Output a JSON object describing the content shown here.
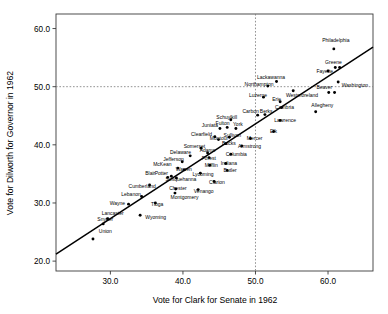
{
  "chart_data": {
    "type": "scatter",
    "title": "",
    "xlabel": "Vote for Clark for Senate in 1962",
    "ylabel": "Vote for Dilworth for Governor in 1962",
    "xlim": [
      22.5,
      66.2
    ],
    "ylim": [
      18.3,
      62.5
    ],
    "xticks": [
      "30.0",
      "40.0",
      "50.0",
      "60.0"
    ],
    "xtick_values": [
      30.0,
      40.0,
      50.0,
      60.0
    ],
    "yticks": [
      "20.0",
      "30.0",
      "40.0",
      "50.0",
      "60.0"
    ],
    "ytick_values": [
      20.0,
      30.0,
      40.0,
      50.0,
      60.0
    ],
    "grid": false,
    "legend": "none",
    "reference_lines": [
      {
        "name": "vertical-50-percent-line",
        "orientation": "vertical",
        "value": 50.0,
        "style": "dotted"
      },
      {
        "name": "horizontal-50-percent-line",
        "orientation": "horizontal",
        "value": 50.0,
        "style": "dotted"
      }
    ],
    "fit_line": {
      "name": "regression-line",
      "x0": 22.5,
      "y0": 21.2,
      "x1": 66.2,
      "y1": 56.8
    },
    "points": [
      {
        "label": "Union",
        "x": 27.6,
        "y": 23.8,
        "lx": 28.4,
        "ly": 24.9,
        "anchor": "start"
      },
      {
        "label": "Snyder",
        "x": 29.0,
        "y": 26.4,
        "lx": 28.2,
        "ly": 26.9,
        "anchor": "start"
      },
      {
        "label": "Lancaster",
        "x": 29.6,
        "y": 27.3,
        "lx": 28.8,
        "ly": 27.9,
        "anchor": "start"
      },
      {
        "label": "Wayne",
        "x": 32.5,
        "y": 29.8,
        "lx": 29.9,
        "ly": 29.7,
        "anchor": "start"
      },
      {
        "label": "Lebanon",
        "x": 34.3,
        "y": 31.1,
        "lx": 31.5,
        "ly": 31.2,
        "anchor": "start"
      },
      {
        "label": "Wyoming",
        "x": 34.1,
        "y": 27.9,
        "lx": 34.8,
        "ly": 27.2,
        "anchor": "start"
      },
      {
        "label": "Tioga",
        "x": 36.2,
        "y": 30.0,
        "lx": 35.6,
        "ly": 29.4,
        "anchor": "start"
      },
      {
        "label": "Cumberland",
        "x": 35.4,
        "y": 33.1,
        "lx": 32.5,
        "ly": 32.6,
        "anchor": "start"
      },
      {
        "label": "Blair",
        "x": 37.9,
        "y": 34.4,
        "lx": 34.8,
        "ly": 34.8,
        "anchor": "start"
      },
      {
        "label": "Potter",
        "x": 38.4,
        "y": 34.6,
        "lx": 36.1,
        "ly": 34.8,
        "anchor": "start"
      },
      {
        "label": "Montgomery",
        "x": 38.9,
        "y": 31.7,
        "lx": 38.3,
        "ly": 30.7,
        "anchor": "start"
      },
      {
        "label": "Chester",
        "x": 39.0,
        "y": 32.4,
        "lx": 38.1,
        "ly": 32.2,
        "anchor": "start"
      },
      {
        "label": "Susquehanna",
        "x": 39.1,
        "y": 34.3,
        "lx": 37.6,
        "ly": 33.8,
        "anchor": "start"
      },
      {
        "label": "McKean",
        "x": 39.3,
        "y": 36.0,
        "lx": 35.9,
        "ly": 36.4,
        "anchor": "start"
      },
      {
        "label": "Jefferson",
        "x": 39.9,
        "y": 37.1,
        "lx": 37.3,
        "ly": 37.3,
        "anchor": "start"
      },
      {
        "label": "Warren",
        "x": 40.2,
        "y": 35.7,
        "lx": 39.0,
        "ly": 35.5,
        "anchor": "start"
      },
      {
        "label": "Delaware",
        "x": 41.0,
        "y": 38.1,
        "lx": 38.2,
        "ly": 38.4,
        "anchor": "start"
      },
      {
        "label": "Venango",
        "x": 42.1,
        "y": 32.3,
        "lx": 41.5,
        "ly": 31.8,
        "anchor": "start"
      },
      {
        "label": "Lycoming",
        "x": 42.4,
        "y": 35.1,
        "lx": 41.3,
        "ly": 34.7,
        "anchor": "start"
      },
      {
        "label": "Somerset",
        "x": 42.5,
        "y": 39.4,
        "lx": 40.1,
        "ly": 39.5,
        "anchor": "start"
      },
      {
        "label": "Clarion",
        "x": 44.3,
        "y": 33.7,
        "lx": 43.6,
        "ly": 33.3,
        "anchor": "start"
      },
      {
        "label": "Mifflin",
        "x": 43.7,
        "y": 36.5,
        "lx": 43.0,
        "ly": 36.2,
        "anchor": "start"
      },
      {
        "label": "Forest",
        "x": 43.6,
        "y": 37.8,
        "lx": 42.6,
        "ly": 37.4,
        "anchor": "start"
      },
      {
        "label": "Adams",
        "x": 43.4,
        "y": 38.6,
        "lx": 42.3,
        "ly": 38.8,
        "anchor": "start"
      },
      {
        "label": "Clearfield",
        "x": 44.4,
        "y": 41.4,
        "lx": 41.1,
        "ly": 41.6,
        "anchor": "start"
      },
      {
        "label": "Montour",
        "x": 44.9,
        "y": 40.9,
        "lx": 43.7,
        "ly": 40.8,
        "anchor": "start"
      },
      {
        "label": "Butler",
        "x": 46.1,
        "y": 35.6,
        "lx": 45.6,
        "ly": 35.3,
        "anchor": "start"
      },
      {
        "label": "Indiana",
        "x": 45.9,
        "y": 36.8,
        "lx": 45.2,
        "ly": 36.6,
        "anchor": "start"
      },
      {
        "label": "Columbia",
        "x": 46.6,
        "y": 38.4,
        "lx": 45.9,
        "ly": 38.1,
        "anchor": "start"
      },
      {
        "label": "Bucks",
        "x": 45.9,
        "y": 40.2,
        "lx": 45.4,
        "ly": 40.0,
        "anchor": "start"
      },
      {
        "label": "Sullivan",
        "x": 46.4,
        "y": 41.3,
        "lx": 45.6,
        "ly": 41.4,
        "anchor": "start"
      },
      {
        "label": "Juniata",
        "x": 45.1,
        "y": 42.8,
        "lx": 42.6,
        "ly": 43.0,
        "anchor": "start"
      },
      {
        "label": "Fulton",
        "x": 46.1,
        "y": 43.0,
        "lx": 44.5,
        "ly": 43.4,
        "anchor": "start"
      },
      {
        "label": "Schuylkill",
        "x": 46.6,
        "y": 44.3,
        "lx": 44.6,
        "ly": 44.5,
        "anchor": "start"
      },
      {
        "label": "York",
        "x": 47.3,
        "y": 42.8,
        "lx": 46.9,
        "ly": 43.3,
        "anchor": "start"
      },
      {
        "label": "Armstrong",
        "x": 48.1,
        "y": 39.8,
        "lx": 47.6,
        "ly": 39.5,
        "anchor": "start"
      },
      {
        "label": "Mercer",
        "x": 49.3,
        "y": 41.1,
        "lx": 48.8,
        "ly": 40.8,
        "anchor": "start"
      },
      {
        "label": "Carbon",
        "x": 50.3,
        "y": 45.1,
        "lx": 48.2,
        "ly": 45.4,
        "anchor": "start"
      },
      {
        "label": "Berks",
        "x": 51.3,
        "y": 45.2,
        "lx": 50.6,
        "ly": 45.5,
        "anchor": "start"
      },
      {
        "label": "Luzerne",
        "x": 51.1,
        "y": 48.2,
        "lx": 49.1,
        "ly": 48.3,
        "anchor": "start"
      },
      {
        "label": "Northampton",
        "x": 51.7,
        "y": 50.1,
        "lx": 48.5,
        "ly": 50.1,
        "anchor": "start"
      },
      {
        "label": "Lackawanna",
        "x": 52.9,
        "y": 50.9,
        "lx": 50.2,
        "ly": 51.4,
        "anchor": "start"
      },
      {
        "label": "Elk",
        "x": 52.5,
        "y": 42.3,
        "lx": 52.0,
        "ly": 42.0,
        "anchor": "start"
      },
      {
        "label": "Lawrence",
        "x": 53.4,
        "y": 44.2,
        "lx": 52.6,
        "ly": 44.0,
        "anchor": "start"
      },
      {
        "label": "Cambria",
        "x": 53.6,
        "y": 46.4,
        "lx": 52.7,
        "ly": 46.2,
        "anchor": "start"
      },
      {
        "label": "Erie",
        "x": 53.4,
        "y": 47.4,
        "lx": 52.3,
        "ly": 47.6,
        "anchor": "start"
      },
      {
        "label": "Westmoreland",
        "x": 55.2,
        "y": 49.3,
        "lx": 54.2,
        "ly": 48.2,
        "anchor": "start"
      },
      {
        "label": "Allegheny",
        "x": 58.3,
        "y": 45.7,
        "lx": 57.7,
        "ly": 46.5,
        "anchor": "start"
      },
      {
        "label": "Beaver",
        "x": 60.1,
        "y": 49.0,
        "lx": 58.4,
        "ly": 49.6,
        "anchor": "start"
      },
      {
        "label": "Washington",
        "x": 61.4,
        "y": 50.8,
        "lx": 61.9,
        "ly": 50.0,
        "anchor": "start"
      },
      {
        "label": "Fayette",
        "x": 60.0,
        "y": 52.7,
        "lx": 58.4,
        "ly": 52.4,
        "anchor": "start"
      },
      {
        "label": "Greene",
        "x": 61.0,
        "y": 53.3,
        "lx": 59.6,
        "ly": 53.9,
        "anchor": "start"
      },
      {
        "label": "Philadelphia",
        "x": 60.8,
        "y": 56.5,
        "lx": 59.2,
        "ly": 57.6,
        "anchor": "start"
      },
      {
        "label": "Unnamed1",
        "x": 60.9,
        "y": 49.0,
        "lx": 0,
        "ly": 0,
        "anchor": "none"
      },
      {
        "label": "Unnamed2",
        "x": 61.6,
        "y": 53.3,
        "lx": 0,
        "ly": 0,
        "anchor": "none"
      }
    ]
  },
  "axes": {
    "x_title": "Vote for Clark for Senate in 1962",
    "y_title": "Vote for Dilworth for Governor in 1962"
  }
}
